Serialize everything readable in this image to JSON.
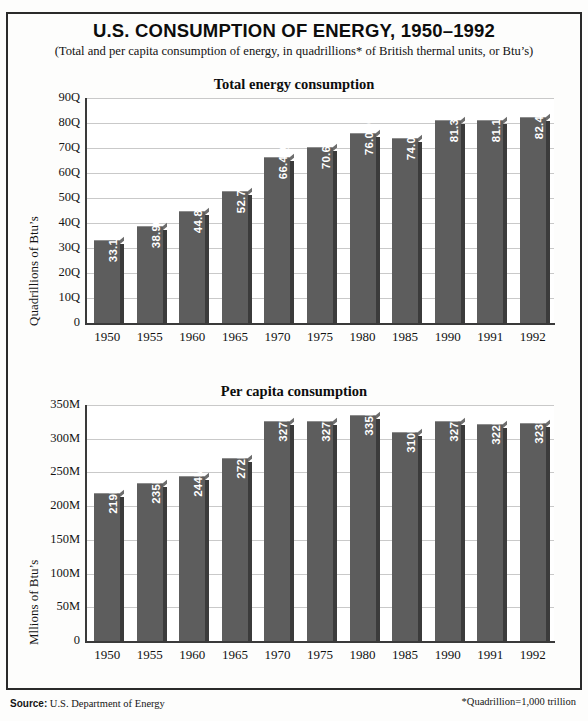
{
  "document": {
    "title": "U.S. CONSUMPTION OF ENERGY, 1950–1992",
    "subtitle": "(Total and per capita consumption of energy, in quadrillions* of British thermal units, or Btu’s)",
    "source_label": "Source:",
    "source_text": "U.S. Department of Energy",
    "footnote": "*Quadrillion=1,000 trillion",
    "bar_color": "#5d5d5d",
    "bar_shadow_color": "#3b3b3b",
    "grid_color": "#c9c9c9",
    "text_color": "#111111"
  },
  "chart_data": [
    {
      "type": "bar",
      "title": "Total energy consumption",
      "xlabel": "",
      "ylabel": "Quadrillions of Btu’s",
      "categories": [
        "1950",
        "1955",
        "1960",
        "1965",
        "1970",
        "1975",
        "1980",
        "1985",
        "1990",
        "1991",
        "1992"
      ],
      "values": [
        33.1,
        38.9,
        44.8,
        52.7,
        66.4,
        70.6,
        76.0,
        74.0,
        81.3,
        81.1,
        82.4
      ],
      "labels": [
        "33.1Q",
        "38.9Q",
        "44.8Q",
        "52.7Q",
        "66.4Q",
        "70.6Q",
        "76.0Q",
        "74.0Q",
        "81.3Q",
        "81.1Q",
        "82.4Q"
      ],
      "yticks": [
        0,
        10,
        20,
        30,
        40,
        50,
        60,
        70,
        80,
        90
      ],
      "ytick_labels": [
        "0",
        "10Q",
        "20Q",
        "30Q",
        "40Q",
        "50Q",
        "60Q",
        "70Q",
        "80Q",
        "90Q"
      ],
      "ylim": [
        0,
        90
      ],
      "grid": true,
      "legend": "none"
    },
    {
      "type": "bar",
      "title": "Per capita consumption",
      "xlabel": "",
      "ylabel": "Mllions of Btu’s",
      "categories": [
        "1950",
        "1955",
        "1960",
        "1965",
        "1970",
        "1975",
        "1980",
        "1985",
        "1990",
        "1991",
        "1992"
      ],
      "values": [
        219,
        235,
        244,
        272,
        327,
        327,
        335,
        310,
        327,
        322,
        323
      ],
      "labels": [
        "219M",
        "235M",
        "244M",
        "272M",
        "327M",
        "327M",
        "335M",
        "310M",
        "327M",
        "322M",
        "323M"
      ],
      "yticks": [
        0,
        50,
        100,
        150,
        200,
        250,
        300,
        350
      ],
      "ytick_labels": [
        "0",
        "50M",
        "100M",
        "150M",
        "200M",
        "250M",
        "300M",
        "350M"
      ],
      "ylim": [
        0,
        350
      ],
      "grid": true,
      "legend": "none"
    }
  ]
}
